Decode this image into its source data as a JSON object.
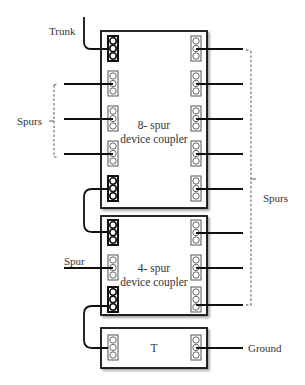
{
  "diagram": {
    "labels": {
      "trunk": "Trunk",
      "spurs_left": "Spurs",
      "spurs_right": "Spurs",
      "spur": "Spur",
      "ground": "Ground"
    },
    "couplers": [
      {
        "id": "coupler-8",
        "title_line1": "8- spur",
        "title_line2": "device coupler"
      },
      {
        "id": "coupler-4",
        "title_line1": "4- spur",
        "title_line2": "device coupler"
      },
      {
        "id": "terminator",
        "title_line1": "T"
      }
    ]
  }
}
